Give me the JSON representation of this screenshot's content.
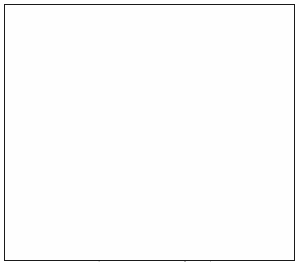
{
  "figure": {
    "title": "Outline map of the contiguous United States",
    "type": "reference-map",
    "projection_note": "conic, north America",
    "width_px": 299,
    "height_px": 265,
    "background_color": "#ffffff",
    "frame_color": "#1a1a1a",
    "coastline_color": "#111111",
    "state_border_color": "#9a9a9a",
    "marker_color": "#2a2a2a",
    "labels_visible": false,
    "legend_visible": false,
    "graticule_visible": false
  },
  "frame": {
    "left_px": 4,
    "top_px": 4,
    "width_px": 291,
    "height_px": 257,
    "stroke_px": 1.6
  },
  "map": {
    "region": "United States (lower 48) with parts of Canada, Mexico, Cuba and the Bahamas",
    "features": [
      {
        "name": "us-mainland-coastline",
        "kind": "coastline",
        "color": "#111111"
      },
      {
        "name": "canada-coastline",
        "kind": "coastline",
        "color": "#111111"
      },
      {
        "name": "mexico-coastline",
        "kind": "coastline",
        "color": "#111111"
      },
      {
        "name": "baja-california-peninsula",
        "kind": "coastline",
        "color": "#111111"
      },
      {
        "name": "vancouver-island",
        "kind": "island",
        "color": "#111111"
      },
      {
        "name": "cuba",
        "kind": "island",
        "color": "#111111"
      },
      {
        "name": "bahamas",
        "kind": "island",
        "color": "#111111"
      },
      {
        "name": "nova-scotia",
        "kind": "island",
        "color": "#111111"
      },
      {
        "name": "long-island",
        "kind": "island",
        "color": "#111111"
      },
      {
        "name": "great-lakes",
        "kind": "lakes",
        "color": "#111111"
      },
      {
        "name": "lake-winnipeg",
        "kind": "lake",
        "color": "#111111"
      },
      {
        "name": "great-salt-lake",
        "kind": "lake",
        "color": "#111111"
      },
      {
        "name": "state-boundaries",
        "kind": "internal-borders",
        "color": "#9a9a9a"
      },
      {
        "name": "san-francisco-bay-marker",
        "kind": "point-marker",
        "color": "#2a2a2a"
      }
    ],
    "lakes": [
      {
        "label": "Lake Superior"
      },
      {
        "label": "Lake Michigan"
      },
      {
        "label": "Lake Huron"
      },
      {
        "label": "Lake Erie"
      },
      {
        "label": "Lake Ontario"
      },
      {
        "label": "Lake Winnipeg"
      },
      {
        "label": "Great Salt Lake"
      }
    ],
    "marker": {
      "label": "San Francisco Bay",
      "x_px": 21,
      "y_px": 126,
      "radius_px": 3.1,
      "color": "#2a2a2a"
    }
  }
}
